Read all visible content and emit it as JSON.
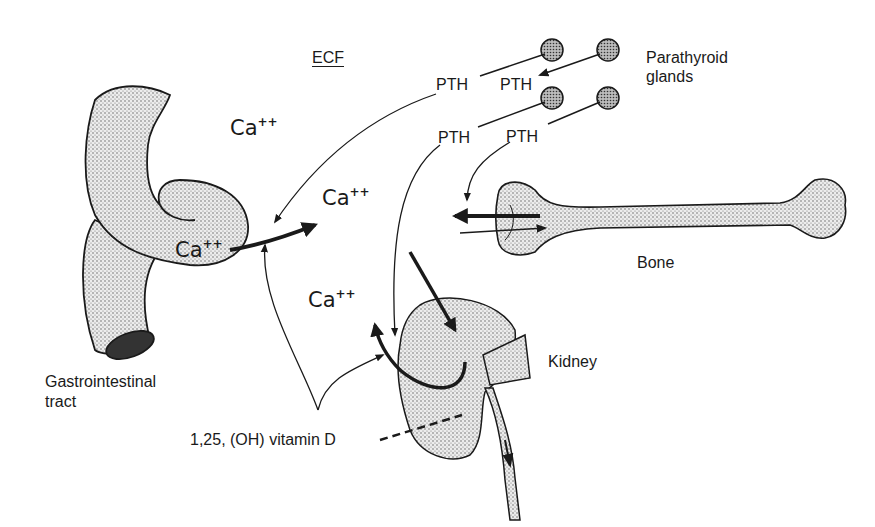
{
  "diagram": {
    "compartment_label": "ECF",
    "hormone": "PTH",
    "ion": {
      "symbol": "Ca",
      "charge": "++"
    },
    "organs": {
      "parathyroid": "Parathyroid glands",
      "parathyroid_line1": "Parathyroid",
      "parathyroid_line2": "glands",
      "gi": "Gastrointestinal tract",
      "gi_line1": "Gastrointestinal",
      "gi_line2": "tract",
      "bone": "Bone",
      "kidney": "Kidney"
    },
    "vitamin_d": "1,25, (OH) vitamin D",
    "pth_labels": [
      "PTH",
      "PTH",
      "PTH",
      "PTH"
    ],
    "ca_labels": [
      "Ca",
      "Ca",
      "Ca",
      "Ca"
    ],
    "colors": {
      "ink": "#1a1a1a",
      "stipple": "#cfcfcf",
      "background": "#ffffff"
    }
  }
}
